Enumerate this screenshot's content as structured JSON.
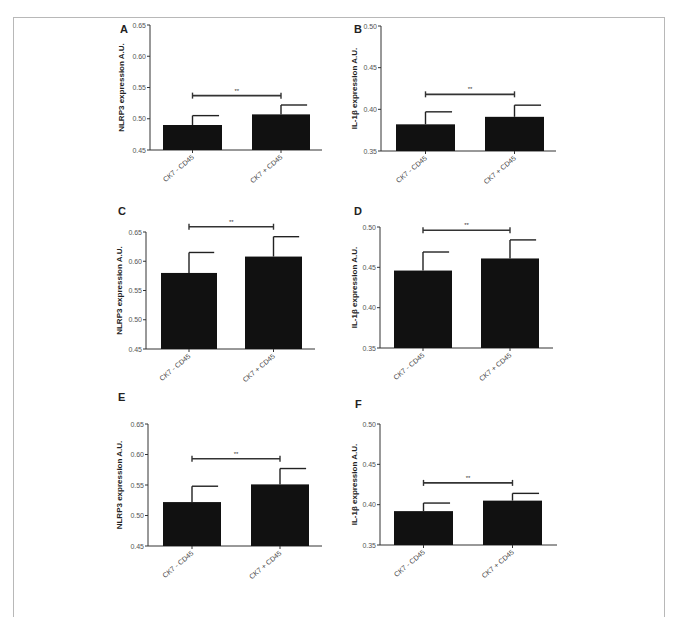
{
  "figure": {
    "category_labels": [
      "CK7 - CD45",
      "CK7 + CD45"
    ],
    "significance_label": "**"
  },
  "chart_data": [
    {
      "panel": "A",
      "type": "bar",
      "title": "",
      "categories": [
        "CK7 - CD45",
        "CK7 + CD45"
      ],
      "values": [
        0.49,
        0.507
      ],
      "error_upper": [
        0.505,
        0.522
      ],
      "ylabel": "NLRP3 expression A.U.",
      "xlabel": "",
      "ylim": [
        0.45,
        0.65
      ],
      "yticks": [
        "0.45",
        "0.50",
        "0.55",
        "0.60",
        "0.65"
      ],
      "significance": {
        "label": "**",
        "y": 0.537
      },
      "grid": false,
      "legend": null,
      "bar_color": "#111111"
    },
    {
      "panel": "B",
      "type": "bar",
      "title": "",
      "categories": [
        "CK7 - CD45",
        "CK7 + CD45"
      ],
      "values": [
        0.382,
        0.391
      ],
      "error_upper": [
        0.397,
        0.405
      ],
      "ylabel": "IL-1β expression A.U.",
      "xlabel": "",
      "ylim": [
        0.35,
        0.5
      ],
      "yticks": [
        "0.35",
        "0.40",
        "0.45",
        "0.50"
      ],
      "significance": {
        "label": "**",
        "y": 0.418
      },
      "grid": false,
      "legend": null,
      "bar_color": "#111111"
    },
    {
      "panel": "C",
      "type": "bar",
      "title": "",
      "categories": [
        "CK7 - CD45",
        "CK7 + CD45"
      ],
      "values": [
        0.58,
        0.608
      ],
      "error_upper": [
        0.615,
        0.642
      ],
      "ylabel": "NLRP3 expression A.U.",
      "xlabel": "",
      "ylim": [
        0.45,
        0.65
      ],
      "yticks": [
        "0.45",
        "0.50",
        "0.55",
        "0.60",
        "0.65"
      ],
      "significance": {
        "label": "**",
        "y": 0.659
      },
      "grid": false,
      "legend": null,
      "bar_color": "#111111"
    },
    {
      "panel": "D",
      "type": "bar",
      "title": "",
      "categories": [
        "CK7 - CD45",
        "CK7 + CD45"
      ],
      "values": [
        0.446,
        0.461
      ],
      "error_upper": [
        0.469,
        0.484
      ],
      "ylabel": "IL-1β expression A.U.",
      "xlabel": "",
      "ylim": [
        0.35,
        0.5
      ],
      "yticks": [
        "0.35",
        "0.40",
        "0.45",
        "0.50"
      ],
      "significance": {
        "label": "**",
        "y": 0.496
      },
      "grid": false,
      "legend": null,
      "bar_color": "#111111"
    },
    {
      "panel": "E",
      "type": "bar",
      "title": "",
      "categories": [
        "CK7 - CD45",
        "CK7 + CD45"
      ],
      "values": [
        0.522,
        0.551
      ],
      "error_upper": [
        0.548,
        0.577
      ],
      "ylabel": "NLRP3 expression A.U.",
      "xlabel": "",
      "ylim": [
        0.45,
        0.65
      ],
      "yticks": [
        "0.45",
        "0.50",
        "0.55",
        "0.60",
        "0.65"
      ],
      "significance": {
        "label": "**",
        "y": 0.593
      },
      "grid": false,
      "legend": null,
      "bar_color": "#111111"
    },
    {
      "panel": "F",
      "type": "bar",
      "title": "",
      "categories": [
        "CK7 - CD45",
        "CK7 + CD45"
      ],
      "values": [
        0.392,
        0.405
      ],
      "error_upper": [
        0.402,
        0.414
      ],
      "ylabel": "IL-1β expression A.U.",
      "xlabel": "",
      "ylim": [
        0.35,
        0.5
      ],
      "yticks": [
        "0.35",
        "0.40",
        "0.45",
        "0.50"
      ],
      "significance": {
        "label": "**",
        "y": 0.427
      },
      "grid": false,
      "legend": null,
      "bar_color": "#111111"
    }
  ],
  "layout": {
    "panels": [
      {
        "axis_x": 150,
        "axis_top": 25,
        "axis_bottom": 150,
        "axis_right": 322,
        "bars": [
          [
            163,
            59
          ],
          [
            252,
            58
          ]
        ],
        "letter_x": 120,
        "letter_y": 33,
        "ylabel_x": 124
      },
      {
        "axis_x": 381,
        "axis_top": 26,
        "axis_bottom": 151,
        "axis_right": 556,
        "bars": [
          [
            396,
            59
          ],
          [
            485,
            59
          ]
        ],
        "letter_x": 354,
        "letter_y": 33,
        "ylabel_x": 357
      },
      {
        "axis_x": 146,
        "axis_top": 232,
        "axis_bottom": 349,
        "axis_right": 315,
        "bars": [
          [
            161,
            56
          ],
          [
            245,
            57
          ]
        ],
        "letter_x": 118,
        "letter_y": 215,
        "ylabel_x": 122
      },
      {
        "axis_x": 380,
        "axis_top": 227,
        "axis_bottom": 348,
        "axis_right": 553,
        "bars": [
          [
            394,
            58
          ],
          [
            481,
            58
          ]
        ],
        "letter_x": 354,
        "letter_y": 215,
        "ylabel_x": 357
      },
      {
        "axis_x": 148,
        "axis_top": 424,
        "axis_bottom": 546,
        "axis_right": 322,
        "bars": [
          [
            163,
            58
          ],
          [
            251,
            58
          ]
        ],
        "letter_x": 118,
        "letter_y": 401,
        "ylabel_x": 122
      },
      {
        "axis_x": 380,
        "axis_top": 424,
        "axis_bottom": 545,
        "axis_right": 557,
        "bars": [
          [
            394,
            59
          ],
          [
            483,
            59
          ]
        ],
        "letter_x": 355,
        "letter_y": 408,
        "ylabel_x": 357
      }
    ]
  }
}
